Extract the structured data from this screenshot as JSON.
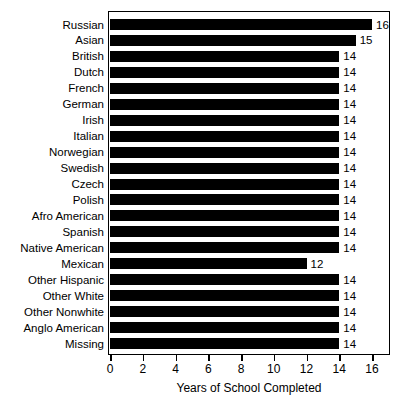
{
  "chart_data": {
    "type": "bar",
    "orientation": "horizontal",
    "title": "",
    "xlabel": "Years of School Completed",
    "ylabel": "",
    "xlim": [
      0,
      17
    ],
    "xticks": [
      0,
      2,
      4,
      6,
      8,
      10,
      12,
      14,
      16
    ],
    "grid": false,
    "legend": null,
    "bar_color": "#000000",
    "background_color": "#ffffff",
    "categories": [
      "Russian",
      "Asian",
      "British",
      "Dutch",
      "French",
      "German",
      "Irish",
      "Italian",
      "Norwegian",
      "Swedish",
      "Czech",
      "Polish",
      "Afro American",
      "Spanish",
      "Native American",
      "Mexican",
      "Other Hispanic",
      "Other White",
      "Other Nonwhite",
      "Anglo American",
      "Missing"
    ],
    "values": [
      16,
      15,
      14,
      14,
      14,
      14,
      14,
      14,
      14,
      14,
      14,
      14,
      14,
      14,
      14,
      12,
      14,
      14,
      14,
      14,
      14
    ],
    "value_labels": [
      "16",
      "15",
      "14",
      "14",
      "14",
      "14",
      "14",
      "14",
      "14",
      "14",
      "14",
      "14",
      "14",
      "14",
      "14",
      "12",
      "14",
      "14",
      "14",
      "14",
      "14"
    ]
  }
}
